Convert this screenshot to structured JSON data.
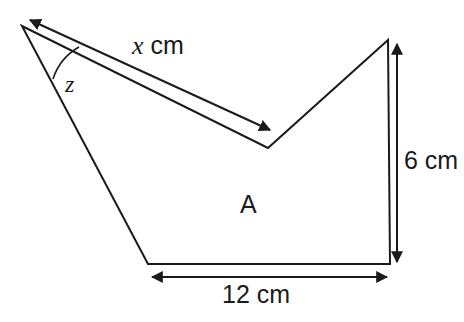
{
  "figure": {
    "type": "geometry-diagram",
    "background_color": "#ffffff",
    "stroke_color": "#1a1a1a",
    "labels": {
      "x_length": "x",
      "x_units": " cm",
      "angle": "z",
      "region": "A",
      "height": "6 cm",
      "base": "12 cm"
    },
    "shape": {
      "name": "arrowhead-polygon",
      "points": "22,26 268,148 388,40 390,264 148,264",
      "fill": "none"
    },
    "lines": {
      "x_measure_line": {
        "x1": 30,
        "y1": 20,
        "x2": 270,
        "y2": 130
      },
      "height_measure_line": {
        "x1": 397,
        "y1": 42,
        "x2": 397,
        "y2": 263
      },
      "base_measure_line": {
        "x1": 150,
        "y1": 277,
        "x2": 389,
        "y2": 277
      }
    },
    "angle_arc": {
      "vertex_x": 22,
      "vertex_y": 26,
      "radius": 57,
      "path": "M 53,79 A 57,57 0 0 1 79,47"
    }
  }
}
